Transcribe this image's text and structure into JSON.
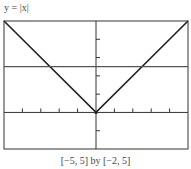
{
  "figure": {
    "title": "y = |x|",
    "caption": "[−5, 5] by [−2, 5]"
  },
  "chart_data": {
    "type": "line",
    "title": "y = |x|",
    "xlabel": "",
    "ylabel": "",
    "xlim": [
      -5,
      5
    ],
    "ylim": [
      -2,
      5
    ],
    "x_tick_step": 1,
    "y_tick_step": 1,
    "grid": false,
    "series": [
      {
        "name": "y = |x|",
        "x": [
          -5,
          0,
          5
        ],
        "y": [
          5,
          0,
          5
        ],
        "color": "#222222"
      },
      {
        "name": "y = 2.5",
        "x": [
          -5,
          5
        ],
        "y": [
          2.5,
          2.5
        ],
        "color": "#555555"
      }
    ],
    "window_caption": "[−5, 5] by [−2, 5]"
  },
  "colors": {
    "frame": "#555555",
    "axes": "#333333",
    "curve": "#222222",
    "hline": "#555555"
  }
}
